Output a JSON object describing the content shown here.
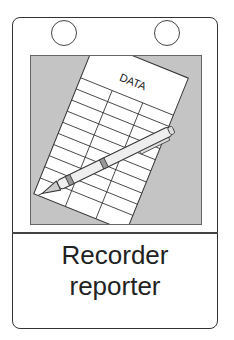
{
  "card": {
    "title_line1": "Recorder",
    "title_line2": "reporter",
    "illustration": {
      "sheet_heading": "DATA",
      "icons": [
        "data-sheet-icon",
        "pen-icon"
      ]
    }
  },
  "colors": {
    "panel_bg": "#c4c4c4",
    "outline": "#333333",
    "paper": "#ffffff"
  }
}
